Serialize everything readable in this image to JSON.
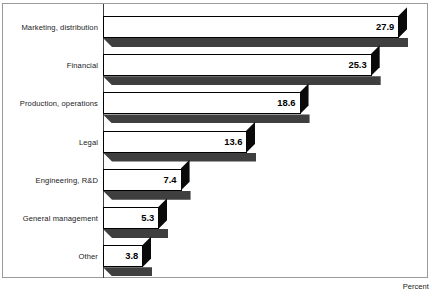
{
  "chart_data": {
    "type": "bar",
    "orientation": "horizontal",
    "title": "",
    "xlabel": "Percent",
    "ylabel": "",
    "categories": [
      "Marketing, distribution",
      "Financial",
      "Production, operations",
      "Legal",
      "Engineering, R&D",
      "General management",
      "Other"
    ],
    "values": [
      27.9,
      25.3,
      18.6,
      13.6,
      7.4,
      5.3,
      3.8
    ],
    "value_labels": [
      "27.9",
      "25.3",
      "18.6",
      "13.6",
      "7.4",
      "5.3",
      "3.8"
    ],
    "xlim": [
      0,
      30
    ],
    "grid": false,
    "legend": null,
    "style": {
      "bar_face_color": "#ffffff",
      "bar_outline_color": "#000000",
      "bar_shadow_color": "#3f3f3f",
      "bar_cap_color": "#0a0a0a",
      "frame_color": "#9a9a9a",
      "axis_color": "#3d3d3d",
      "text_color": "#1b1b1b"
    }
  },
  "axis": {
    "percent_label": "Percent"
  }
}
